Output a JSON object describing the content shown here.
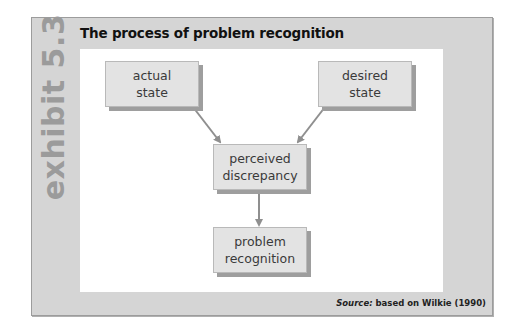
{
  "exhibit": {
    "label": "exhibit 5.3",
    "title": "The process of problem recognition"
  },
  "diagram": {
    "nodes": [
      {
        "id": "actual",
        "line1": "actual",
        "line2": "state"
      },
      {
        "id": "desired",
        "line1": "desired",
        "line2": "state"
      },
      {
        "id": "discrepancy",
        "line1": "perceived",
        "line2": "discrepancy"
      },
      {
        "id": "recognition",
        "line1": "problem",
        "line2": "recognition"
      }
    ],
    "edges": [
      {
        "from": "actual",
        "to": "discrepancy"
      },
      {
        "from": "desired",
        "to": "discrepancy"
      },
      {
        "from": "discrepancy",
        "to": "recognition"
      }
    ]
  },
  "source": {
    "prefix": "Source:",
    "text": " based on Wilkie (1990)"
  },
  "colors": {
    "frame": "#d5d5d5",
    "box_fill": "#e3e3e3",
    "box_shadow": "#9e9e9e",
    "arrow": "#8f8f8f",
    "side_label": "#9b9b9b"
  }
}
